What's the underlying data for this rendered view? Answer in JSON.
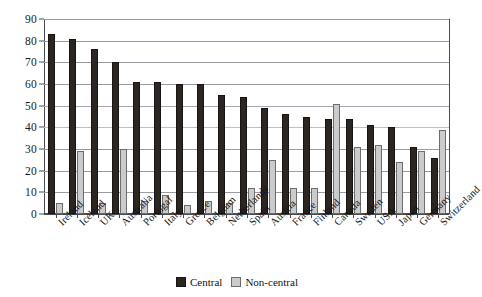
{
  "chart_data": {
    "type": "bar",
    "title": "",
    "subtitle": "",
    "xlabel": "",
    "ylabel": "",
    "ylim": [
      0,
      90
    ],
    "ytick_step": 10,
    "yticks": [
      0,
      10,
      20,
      30,
      40,
      50,
      60,
      70,
      80,
      90
    ],
    "grid": true,
    "grid_axis": "y",
    "legend_position": "bottom-center",
    "categories": [
      "Ireland",
      "Iceland",
      "UK",
      "Australia",
      "Portugal",
      "Italy",
      "Greece",
      "Belgium",
      "Netherlands",
      "Spain",
      "Austria",
      "France",
      "Finland",
      "Canada",
      "Sweden",
      "USA",
      "Japan",
      "Germany",
      "Switzerland"
    ],
    "series": [
      {
        "name": "Central",
        "color": "#2b2622",
        "values": [
          83,
          81,
          76,
          70,
          61,
          61,
          60,
          60,
          55,
          54,
          49,
          46,
          45,
          44,
          44,
          41,
          40,
          31,
          26
        ]
      },
      {
        "name": "Non-central",
        "color": "#cbcbcb",
        "values": [
          5,
          29,
          5,
          30,
          6,
          9,
          4,
          6,
          5,
          12,
          25,
          12,
          12,
          51,
          31,
          32,
          24,
          29,
          39
        ]
      }
    ]
  },
  "legend": {
    "entries": [
      {
        "label": "Central",
        "swatch": "central-swatch-icon"
      },
      {
        "label": "Non-central",
        "swatch": "noncentral-swatch-icon"
      }
    ]
  }
}
